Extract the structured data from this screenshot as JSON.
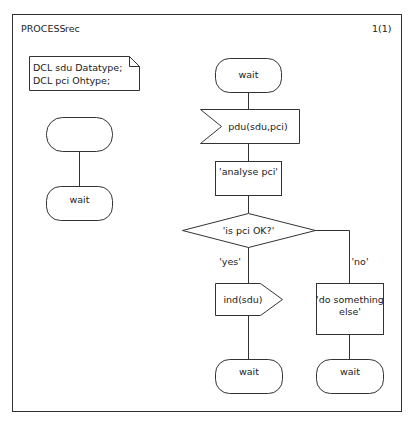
{
  "header": {
    "process_keyword": "PROCESS",
    "process_name": "rec",
    "page": "1(1)"
  },
  "declarations": {
    "lines": [
      "DCL sdu Datatype;",
      "DCL pci Ohtype;"
    ]
  },
  "left_flow": {
    "start_label": "",
    "state_label": "wait"
  },
  "main_flow": {
    "state_top": "wait",
    "input_signal": "pdu(sdu,pci)",
    "task_analyse": "'analyse pci'",
    "decision": "'is pci OK?'",
    "branch_yes": "'yes'",
    "branch_no": "'no'",
    "output_signal": "ind(sdu)",
    "task_else": [
      "'do something",
      "else'"
    ],
    "state_yes": "wait",
    "state_no": "wait"
  }
}
